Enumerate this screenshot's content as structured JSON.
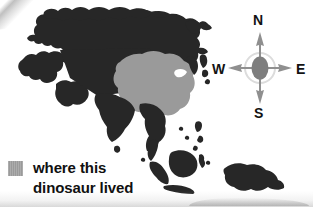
{
  "figure": {
    "kind": "map",
    "background_color": "#ffffff"
  },
  "map": {
    "land_color": "#272727",
    "highlight_color": "#9a9a9a",
    "ocean_color": "#ffffff",
    "regions": [
      {
        "name": "eurasia-landmass",
        "fill": "land"
      },
      {
        "name": "habitat-highlight-east-asia",
        "fill": "highlight"
      },
      {
        "name": "japan-archipelago",
        "fill": "land"
      },
      {
        "name": "indian-subcontinent",
        "fill": "land"
      },
      {
        "name": "sri-lanka",
        "fill": "land"
      },
      {
        "name": "arabian-peninsula",
        "fill": "land"
      },
      {
        "name": "southeast-asia-peninsula",
        "fill": "land"
      },
      {
        "name": "philippines",
        "fill": "land"
      },
      {
        "name": "borneo",
        "fill": "land"
      },
      {
        "name": "sumatra",
        "fill": "land"
      },
      {
        "name": "java",
        "fill": "land"
      },
      {
        "name": "sulawesi",
        "fill": "land"
      },
      {
        "name": "new-guinea-australia-edge",
        "fill": "land"
      }
    ]
  },
  "compass": {
    "name": "compass-rose",
    "arrow_color": "#8f8f8f",
    "label_color": "#131313",
    "center_color": "#7e7e7e",
    "directions": {
      "north": "N",
      "south": "S",
      "east": "E",
      "west": "W"
    }
  },
  "legend": {
    "swatch_color": "#9a9a9a",
    "line1": "where this",
    "line2": "dinosaur lived"
  }
}
